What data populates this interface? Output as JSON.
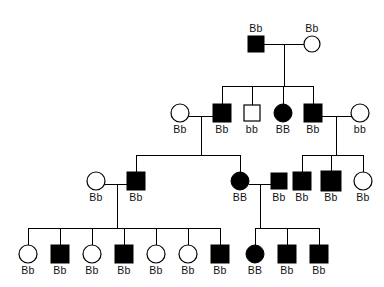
{
  "diagram": {
    "type": "pedigree-chart",
    "title": "",
    "symbol_legend": {
      "square": "male",
      "circle": "female",
      "filled": "affected",
      "open": "unaffected"
    },
    "generations": [
      {
        "id": "I",
        "label_position": "above",
        "individuals": [
          {
            "id": "I-1",
            "shape": "square",
            "fill": "filled",
            "genotype": "Bb",
            "cx": 256,
            "cy": 44
          },
          {
            "id": "I-2",
            "shape": "circle",
            "fill": "open",
            "genotype": "Bb",
            "cx": 312,
            "cy": 44
          }
        ]
      },
      {
        "id": "II",
        "label_position": "below",
        "individuals": [
          {
            "id": "II-1",
            "shape": "circle",
            "fill": "open",
            "genotype": "Bb",
            "cx": 180,
            "cy": 113
          },
          {
            "id": "II-2",
            "shape": "square",
            "fill": "filled",
            "genotype": "Bb",
            "cx": 222,
            "cy": 113
          },
          {
            "id": "II-3",
            "shape": "square",
            "fill": "open",
            "genotype": "bb",
            "cx": 252,
            "cy": 113
          },
          {
            "id": "II-4",
            "shape": "circle",
            "fill": "filled",
            "genotype": "BB",
            "cx": 283,
            "cy": 113
          },
          {
            "id": "II-5",
            "shape": "square",
            "fill": "filled",
            "genotype": "Bb",
            "cx": 313,
            "cy": 113
          },
          {
            "id": "II-6",
            "shape": "circle",
            "fill": "open",
            "genotype": "bb",
            "cx": 360,
            "cy": 113
          }
        ]
      },
      {
        "id": "III",
        "label_position": "below",
        "individuals": [
          {
            "id": "III-1",
            "shape": "circle",
            "fill": "open",
            "genotype": "Bb",
            "cx": 96,
            "cy": 181
          },
          {
            "id": "III-2",
            "shape": "square",
            "fill": "filled",
            "genotype": "Bb",
            "cx": 136,
            "cy": 181
          },
          {
            "id": "III-3",
            "shape": "circle",
            "fill": "filled",
            "genotype": "BB",
            "cx": 240,
            "cy": 181
          },
          {
            "id": "III-4",
            "shape": "square",
            "fill": "filled",
            "genotype": "Bb",
            "cx": 279,
            "cy": 181
          },
          {
            "id": "III-5",
            "shape": "square",
            "fill": "filled",
            "genotype": "Bb",
            "cx": 302,
            "cy": 181
          },
          {
            "id": "III-6",
            "shape": "square",
            "fill": "filled",
            "genotype": "Bb",
            "cx": 331,
            "cy": 181
          },
          {
            "id": "III-7",
            "shape": "circle",
            "fill": "open",
            "genotype": "Bb",
            "cx": 363,
            "cy": 181
          }
        ]
      },
      {
        "id": "IV",
        "label_position": "below",
        "individuals": [
          {
            "id": "IV-1",
            "shape": "circle",
            "fill": "open",
            "genotype": "Bb",
            "cx": 28,
            "cy": 254
          },
          {
            "id": "IV-2",
            "shape": "square",
            "fill": "filled",
            "genotype": "Bb",
            "cx": 60,
            "cy": 254
          },
          {
            "id": "IV-3",
            "shape": "circle",
            "fill": "open",
            "genotype": "Bb",
            "cx": 92,
            "cy": 254
          },
          {
            "id": "IV-4",
            "shape": "square",
            "fill": "filled",
            "genotype": "Bb",
            "cx": 124,
            "cy": 254
          },
          {
            "id": "IV-5",
            "shape": "circle",
            "fill": "open",
            "genotype": "Bb",
            "cx": 156,
            "cy": 254
          },
          {
            "id": "IV-6",
            "shape": "circle",
            "fill": "open",
            "genotype": "Bb",
            "cx": 188,
            "cy": 254
          },
          {
            "id": "IV-7",
            "shape": "square",
            "fill": "filled",
            "genotype": "Bb",
            "cx": 220,
            "cy": 254
          },
          {
            "id": "IV-8",
            "shape": "circle",
            "fill": "filled",
            "genotype": "BB",
            "cx": 255,
            "cy": 254
          },
          {
            "id": "IV-9",
            "shape": "square",
            "fill": "filled",
            "genotype": "Bb",
            "cx": 287,
            "cy": 254
          },
          {
            "id": "IV-10",
            "shape": "square",
            "fill": "filled",
            "genotype": "Bb",
            "cx": 319,
            "cy": 254
          }
        ]
      }
    ],
    "genotypes_flat": [
      "Bb",
      "Bb",
      "Bb",
      "Bb",
      "bb",
      "BB",
      "Bb",
      "bb",
      "Bb",
      "Bb",
      "BB",
      "Bb",
      "Bb",
      "Bb",
      "Bb",
      "Bb",
      "Bb",
      "Bb",
      "Bb",
      "Bb",
      "Bb",
      "Bb",
      "BB",
      "Bb",
      "Bb"
    ],
    "colors": {
      "affected": "#000000",
      "unaffected": "#ffffff",
      "stroke": "#000000",
      "background": "#ffffff",
      "label": "#111111"
    }
  }
}
